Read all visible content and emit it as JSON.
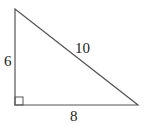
{
  "diagram": {
    "type": "right-triangle",
    "stroke_color": "#555555",
    "vertices": {
      "top": [
        15,
        9
      ],
      "right_angle": [
        15,
        105
      ],
      "right": [
        138,
        105
      ]
    },
    "right_angle_marker": true,
    "labels": {
      "vertical_leg": "6",
      "horizontal_leg": "8",
      "hypotenuse": "10"
    }
  }
}
